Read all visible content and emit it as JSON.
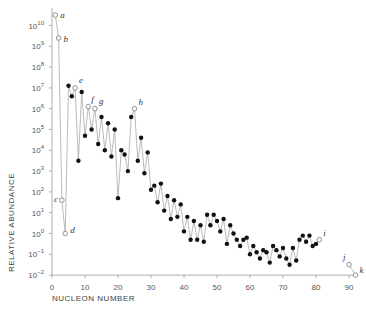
{
  "chart_data": {
    "type": "scatter",
    "title": "",
    "xlabel": "NUCLEON NUMBER",
    "ylabel": "RELATIVE ABUNDANCE",
    "xlim": [
      0,
      92
    ],
    "ylim_log10": [
      -2,
      10.5
    ],
    "y_scale": "log",
    "grid": false,
    "x_ticks": [
      0,
      10,
      20,
      30,
      40,
      50,
      60,
      70,
      80,
      90
    ],
    "y_ticks_log10": [
      10,
      9,
      8,
      7,
      6,
      5,
      4,
      3,
      2,
      1,
      0,
      -1,
      -2
    ],
    "y_tick_labels": [
      "10^10",
      "10^9",
      "10^8",
      "10^7",
      "10^6",
      "10^5",
      "10^4",
      "10^3",
      "10^2",
      "10^1",
      "10^0",
      "10^-1",
      "10^-2"
    ],
    "series": [
      {
        "name": "abundance",
        "x": [
          1,
          2,
          3,
          4,
          5,
          6,
          7,
          8,
          9,
          10,
          11,
          12,
          13,
          14,
          15,
          16,
          17,
          18,
          19,
          20,
          21,
          22,
          23,
          24,
          25,
          26,
          27,
          28,
          29,
          30,
          31,
          32,
          33,
          34,
          35,
          36,
          37,
          38,
          39,
          40,
          41,
          42,
          43,
          44,
          45,
          46,
          47,
          48,
          49,
          50,
          51,
          52,
          53,
          54,
          55,
          56,
          57,
          58,
          59,
          60,
          61,
          62,
          63,
          64,
          65,
          66,
          67,
          68,
          69,
          70,
          71,
          72,
          73,
          74,
          75,
          76,
          77,
          78,
          79,
          80,
          81,
          90,
          92
        ],
        "log10_values": [
          10.5,
          9.4,
          1.6,
          0.0,
          7.1,
          6.6,
          7.0,
          3.5,
          6.8,
          4.7,
          6.1,
          5.0,
          6.0,
          4.3,
          5.6,
          4.0,
          5.3,
          3.7,
          5.0,
          1.7,
          4.0,
          3.8,
          3.0,
          5.6,
          6.0,
          3.5,
          4.6,
          2.9,
          3.9,
          2.1,
          2.3,
          1.5,
          2.4,
          1.1,
          1.8,
          0.7,
          1.6,
          0.8,
          1.4,
          0.1,
          0.8,
          -0.3,
          0.6,
          -0.3,
          0.4,
          -0.4,
          0.9,
          0.4,
          0.9,
          0.6,
          0.1,
          0.7,
          -0.5,
          0.4,
          0.0,
          -0.3,
          -0.6,
          -0.3,
          -0.2,
          -1.0,
          -0.6,
          -0.9,
          -1.2,
          -0.8,
          -0.9,
          -1.4,
          -0.6,
          -0.8,
          -1.1,
          -0.7,
          -1.2,
          -1.5,
          -0.7,
          -1.3,
          -0.3,
          -0.1,
          -0.4,
          -0.1,
          -0.6,
          -0.5,
          -0.3,
          -1.5,
          -2.0
        ],
        "open_points": {
          "a": 1,
          "b": 2,
          "c": 3,
          "d": 4,
          "e": 7,
          "f": 11,
          "g": 13,
          "h": 25,
          "i": 81,
          "j": 90,
          "k": 92
        }
      }
    ],
    "annotations": [
      "a",
      "b",
      "c",
      "d",
      "e",
      "f",
      "g",
      "h",
      "i",
      "j",
      "k"
    ]
  }
}
